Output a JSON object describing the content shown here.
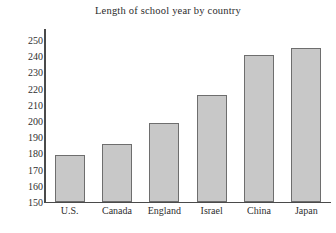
{
  "chart_data": {
    "type": "bar",
    "title": "Length of school year by country",
    "categories": [
      "U.S.",
      "Canada",
      "England",
      "Israel",
      "China",
      "Japan"
    ],
    "values": [
      179,
      186,
      199,
      216,
      241,
      245
    ],
    "xlabel": "",
    "ylabel": "",
    "ylim": [
      150,
      250
    ],
    "yticks": [
      150,
      160,
      170,
      180,
      190,
      200,
      210,
      220,
      230,
      240,
      250
    ],
    "ytick_labels": [
      "150",
      "160",
      "170",
      "180",
      "190",
      "200",
      "210",
      "220",
      "230",
      "240",
      "250"
    ],
    "grid": false,
    "legend": false,
    "bar_fill_color": "#c8c8c8",
    "bar_edge_color": "#6e6e6e",
    "axis_color": "#4a4a4a",
    "background_color": "#ffffff"
  }
}
